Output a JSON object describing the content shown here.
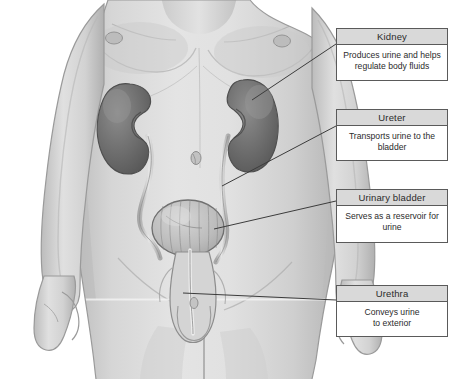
{
  "figure": {
    "style": "grayscale medical illustration",
    "background_color": "#ffffff",
    "skin_tone": "#d2d2d2",
    "organ_color": "#6d6d6d",
    "line_color": "#3c3c3c",
    "organs": [
      {
        "name": "right-kidney",
        "label": "Kidney"
      },
      {
        "name": "left-kidney",
        "label": "Kidney"
      },
      {
        "name": "right-ureter",
        "label": "Ureter"
      },
      {
        "name": "left-ureter",
        "label": "Ureter"
      },
      {
        "name": "urinary-bladder",
        "label": "Urinary bladder"
      },
      {
        "name": "urethra",
        "label": "Urethra"
      }
    ]
  },
  "callouts": [
    {
      "id": "kidney",
      "title": "Kidney",
      "description": "Produces urine and helps\nregulate body fluids"
    },
    {
      "id": "ureter",
      "title": "Ureter",
      "description": "Transports urine to the\nbladder"
    },
    {
      "id": "urinary-bladder",
      "title": "Urinary bladder",
      "description": "Serves as a reservoir for\nurine"
    },
    {
      "id": "urethra",
      "title": "Urethra",
      "description": "Conveys urine\nto exterior"
    }
  ]
}
